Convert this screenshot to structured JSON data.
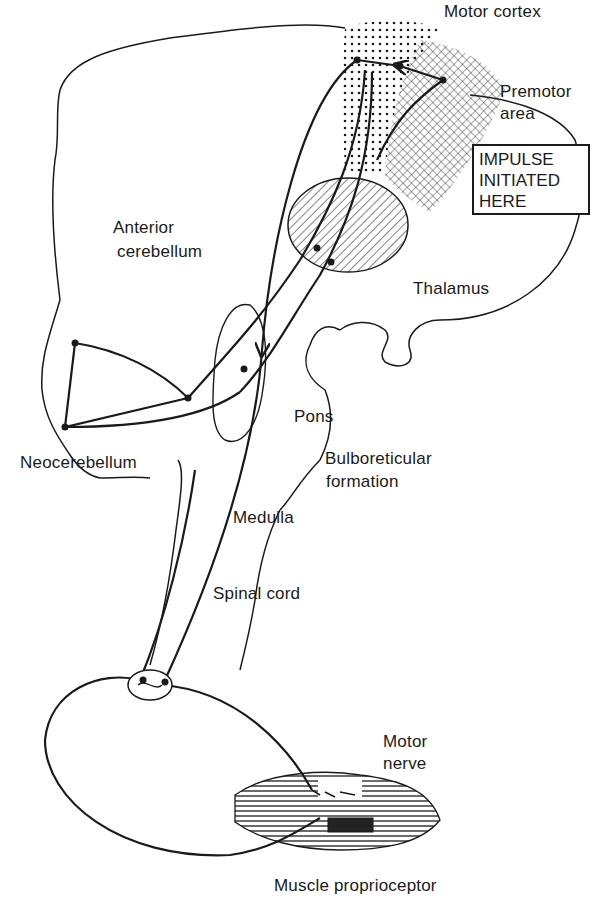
{
  "figure": {
    "ink_color": "#1a1a1a",
    "background_color": "#ffffff"
  },
  "labels": {
    "motor_cortex": "Motor cortex",
    "premotor_area_line1": "Premotor",
    "premotor_area_line2": "area",
    "impulse_box_line1": "IMPULSE",
    "impulse_box_line2": "INITIATED",
    "impulse_box_line3": "HERE",
    "anterior_cerebellum_line1": "Anterior",
    "anterior_cerebellum_line2": "cerebellum",
    "thalamus": "Thalamus",
    "pons": "Pons",
    "neocerebellum": "Neocerebellum",
    "bulboreticular_line1": "Bulboreticular",
    "bulboreticular_line2": "formation",
    "medulla": "Medulla",
    "spinal_cord": "Spinal cord",
    "motor_nerve_line1": "Motor",
    "motor_nerve_line2": "nerve",
    "muscle_proprioceptor": "Muscle proprioceptor"
  }
}
